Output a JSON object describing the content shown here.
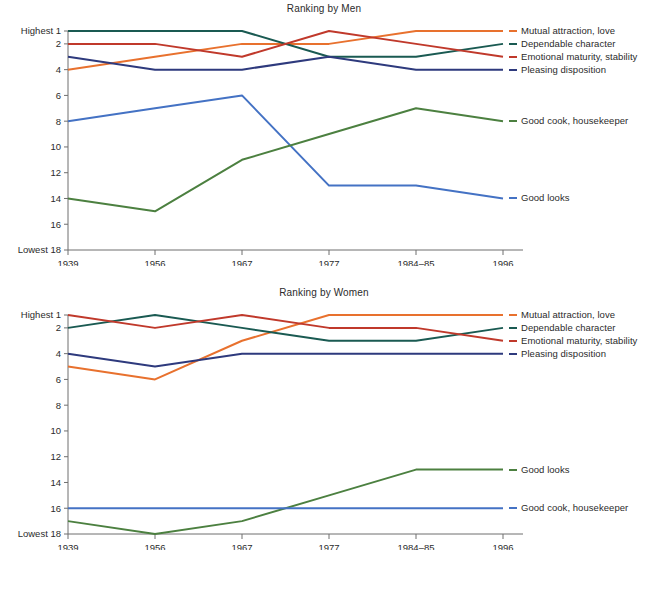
{
  "figure": {
    "panels": [
      {
        "id": "men",
        "title": "Ranking by Men"
      },
      {
        "id": "women",
        "title": "Ranking by Women"
      }
    ],
    "axis": {
      "y_top_label": "Highest 1",
      "y_bottom_label": "Lowest 18",
      "y_ticks": [
        "1",
        "2",
        "4",
        "6",
        "8",
        "10",
        "12",
        "14",
        "16",
        "18"
      ],
      "x_ticks": [
        "1939",
        "1956",
        "1967",
        "1977",
        "1984–85",
        "1996"
      ]
    },
    "colors": {
      "mutual_attraction": "#E8712E",
      "dependable_character": "#1A5A52",
      "emotional_maturity": "#C0392B",
      "pleasing_disposition": "#2E3A7D",
      "good_looks": "#4472C4",
      "good_cook": "#4C8040",
      "axis": "#6F6F6F",
      "text": "#2B2B2B"
    }
  },
  "chart_data": [
    {
      "type": "line",
      "title": "Ranking by Men",
      "xlabel": "",
      "ylabel": "",
      "x": [
        "1939",
        "1956",
        "1967",
        "1977",
        "1984–85",
        "1996"
      ],
      "ylim": [
        1,
        18
      ],
      "y_inverted": true,
      "y_tick_values": [
        1,
        2,
        4,
        6,
        8,
        10,
        12,
        14,
        16,
        18
      ],
      "y_extreme_labels": {
        "top": "Highest 1",
        "bottom": "Lowest 18"
      },
      "grid": false,
      "legend_position": "right-of-lines",
      "series": [
        {
          "name": "Mutual attraction, love",
          "color": "#E8712E",
          "values": [
            4,
            3,
            2,
            2,
            1,
            1
          ]
        },
        {
          "name": "Dependable character",
          "color": "#1A5A52",
          "values": [
            1,
            1,
            1,
            3,
            3,
            2
          ]
        },
        {
          "name": "Emotional maturity, stability",
          "color": "#C0392B",
          "values": [
            2,
            2,
            3,
            1,
            2,
            3
          ]
        },
        {
          "name": "Pleasing disposition",
          "color": "#2E3A7D",
          "values": [
            3,
            4,
            4,
            3,
            4,
            4
          ]
        },
        {
          "name": "Good looks",
          "color": "#4472C4",
          "values": [
            8,
            7,
            6,
            13,
            13,
            14
          ]
        },
        {
          "name": "Good cook, housekeeper",
          "color": "#4C8040",
          "values": [
            14,
            15,
            11,
            9,
            7,
            8
          ]
        }
      ]
    },
    {
      "type": "line",
      "title": "Ranking by Women",
      "xlabel": "",
      "ylabel": "",
      "x": [
        "1939",
        "1956",
        "1967",
        "1977",
        "1984–85",
        "1996"
      ],
      "ylim": [
        1,
        18
      ],
      "y_inverted": true,
      "y_tick_values": [
        1,
        2,
        4,
        6,
        8,
        10,
        12,
        14,
        16,
        18
      ],
      "y_extreme_labels": {
        "top": "Highest 1",
        "bottom": "Lowest 18"
      },
      "grid": false,
      "legend_position": "right-of-lines",
      "series": [
        {
          "name": "Mutual attraction, love",
          "color": "#E8712E",
          "values": [
            5,
            6,
            3,
            1,
            1,
            1
          ]
        },
        {
          "name": "Dependable character",
          "color": "#1A5A52",
          "values": [
            2,
            1,
            2,
            3,
            3,
            2
          ]
        },
        {
          "name": "Emotional maturity, stability",
          "color": "#C0392B",
          "values": [
            1,
            2,
            1,
            2,
            2,
            3
          ]
        },
        {
          "name": "Pleasing disposition",
          "color": "#2E3A7D",
          "values": [
            4,
            5,
            4,
            4,
            4,
            4
          ]
        },
        {
          "name": "Good looks",
          "color": "#4C8040",
          "values": [
            17,
            18,
            17,
            15,
            13,
            13
          ]
        },
        {
          "name": "Good cook, housekeeper",
          "color": "#4472C4",
          "values": [
            16,
            16,
            16,
            16,
            16,
            16
          ]
        }
      ]
    }
  ],
  "legends": {
    "men": [
      {
        "label": "Mutual attraction, love",
        "color": "#E8712E"
      },
      {
        "label": "Dependable character",
        "color": "#1A5A52"
      },
      {
        "label": "Emotional maturity, stability",
        "color": "#C0392B"
      },
      {
        "label": "Pleasing disposition",
        "color": "#2E3A7D"
      },
      {
        "label": "Good looks",
        "color": "#4472C4"
      },
      {
        "label": "Good cook, housekeeper",
        "color": "#4C8040"
      }
    ],
    "women": [
      {
        "label": "Mutual attraction, love",
        "color": "#E8712E"
      },
      {
        "label": "Dependable character",
        "color": "#1A5A52"
      },
      {
        "label": "Emotional maturity, stability",
        "color": "#C0392B"
      },
      {
        "label": "Pleasing disposition",
        "color": "#2E3A7D"
      },
      {
        "label": "Good looks",
        "color": "#4C8040"
      },
      {
        "label": "Good cook, housekeeper",
        "color": "#4472C4"
      }
    ]
  }
}
